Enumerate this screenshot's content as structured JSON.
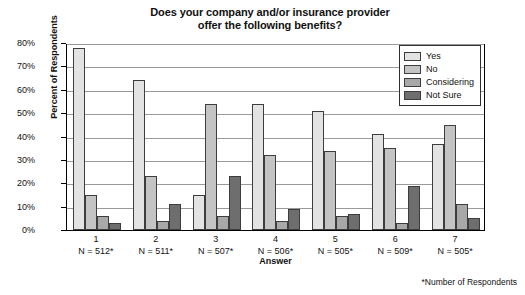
{
  "chart_data": {
    "type": "bar",
    "title": "Does your company and/or insurance provider offer the following benefits?",
    "title_line1": "Does your company and/or insurance provider",
    "title_line2": "offer the following benefits?",
    "xlabel": "Answer",
    "ylabel": "Percent of Respondents",
    "ylim": [
      0,
      80
    ],
    "ytick_labels": [
      "0%",
      "10%",
      "20%",
      "30%",
      "40%",
      "50%",
      "60%",
      "70%",
      "80%"
    ],
    "ytick_values": [
      0,
      10,
      20,
      30,
      40,
      50,
      60,
      70,
      80
    ],
    "grid": true,
    "legend_position": "top-right",
    "categories": [
      "1",
      "2",
      "3",
      "4",
      "5",
      "6",
      "7"
    ],
    "category_sublabels": [
      "N = 512*",
      "N = 511*",
      "N = 507*",
      "N = 506*",
      "N = 505*",
      "N = 509*",
      "N = 505*"
    ],
    "series": [
      {
        "name": "Yes",
        "color": "#e3e3e3",
        "values": [
          78,
          64,
          15,
          54,
          51,
          41,
          37
        ]
      },
      {
        "name": "No",
        "color": "#c4c4c4",
        "values": [
          15,
          23,
          54,
          32,
          34,
          35,
          45
        ]
      },
      {
        "name": "Considering",
        "color": "#a8a8a8",
        "values": [
          6,
          4,
          6,
          4,
          6,
          3,
          11
        ]
      },
      {
        "name": "Not Sure",
        "color": "#6e6e6e",
        "values": [
          3,
          11,
          23,
          9,
          7,
          19,
          5
        ]
      }
    ],
    "annotations": [
      "*Number of Respondents"
    ]
  },
  "footnote": "*Number of Respondents"
}
